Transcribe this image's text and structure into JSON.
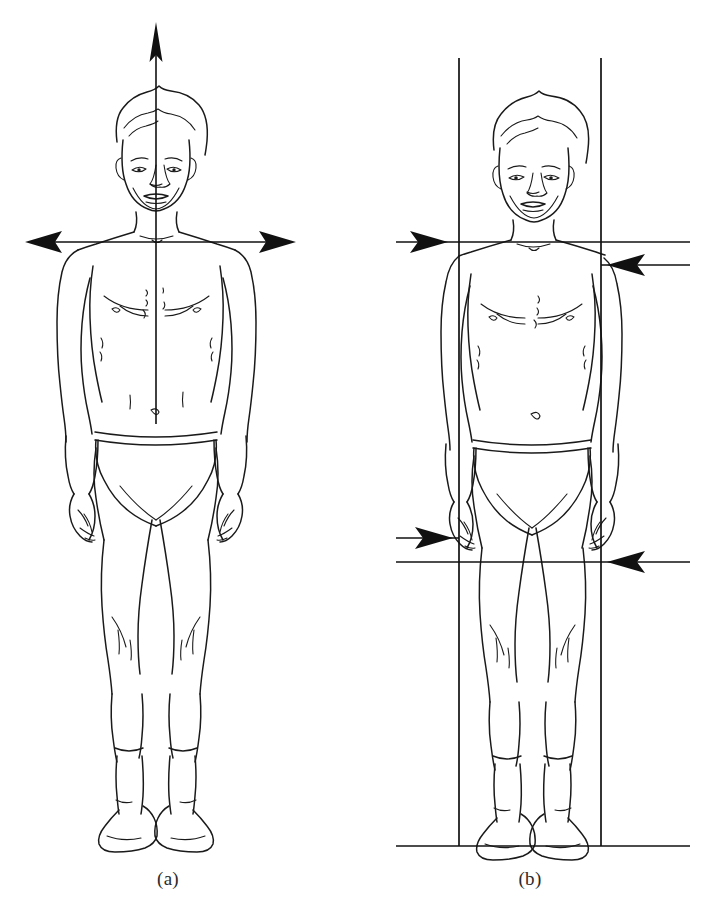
{
  "document": {
    "kind": "anatomical-line-drawing",
    "background_color": "#ffffff",
    "ink_color": "#1a1a1a",
    "width": 706,
    "height": 912
  },
  "panels": [
    {
      "id": "a",
      "caption": "(a)",
      "subject": "standing male figure, anterior view, wearing briefs",
      "overlay": "cross-axis reference lines",
      "elements": [
        {
          "name": "vertical-midline-axis",
          "orientation": "vertical",
          "arrowheads": "up",
          "description": "vertical midline arrow through body center"
        },
        {
          "name": "horizontal-shoulder-axis",
          "orientation": "horizontal",
          "arrowheads": "both",
          "description": "horizontal shoulder-level double arrow"
        }
      ]
    },
    {
      "id": "b",
      "caption": "(b)",
      "subject": "standing male figure, anterior view, wearing briefs",
      "overlay": "plumb lines and level reference lines",
      "elements": [
        {
          "name": "left-plumb-line",
          "orientation": "vertical",
          "description": "left vertical plumb line at shoulder width"
        },
        {
          "name": "right-plumb-line",
          "orientation": "vertical",
          "description": "right vertical plumb line at shoulder width"
        },
        {
          "name": "shoulder-level-line-left",
          "orientation": "horizontal",
          "arrowheads": "right",
          "description": "horizontal line to left acromion with inward arrow"
        },
        {
          "name": "shoulder-level-line-right",
          "orientation": "horizontal",
          "arrowheads": "left",
          "description": "horizontal line to right acromion with inward arrow"
        },
        {
          "name": "hand-level-line-left",
          "orientation": "horizontal",
          "arrowheads": "right",
          "description": "horizontal line to left hand with inward arrow"
        },
        {
          "name": "hand-level-line-right",
          "orientation": "horizontal",
          "arrowheads": "left",
          "description": "horizontal line to right hand with inward arrow"
        },
        {
          "name": "ground-line",
          "orientation": "horizontal",
          "arrowheads": "none",
          "description": "horizontal baseline at the feet"
        }
      ]
    }
  ],
  "captions": {
    "panel_a": "(a)",
    "panel_b": "(b)"
  }
}
